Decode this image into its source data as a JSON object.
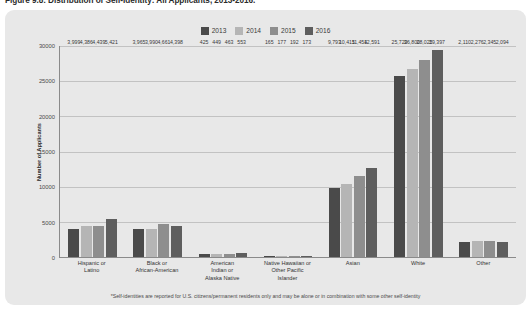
{
  "figure": {
    "title": "Figure 9.8: Distribution of Self-Identity: All Applicants, 2013-2016.",
    "footnote": "*Self-identities are reported for U.S. citizens/permanent residents only and may be alone or in combination with some other self-identity"
  },
  "legend": {
    "position": "top-center",
    "items": [
      {
        "label": "2013",
        "color": "#4a4a4a"
      },
      {
        "label": "2014",
        "color": "#b5b5b5"
      },
      {
        "label": "2015",
        "color": "#8e8e8e"
      },
      {
        "label": "2016",
        "color": "#5e5e5e"
      }
    ]
  },
  "chart_data": {
    "type": "bar",
    "title": "Figure 9.8: Distribution of Self-Identity: All Applicants, 2013-2016.",
    "xlabel": "",
    "ylabel": "Number of Applicants",
    "ylim": [
      0,
      30000
    ],
    "yticks": [
      0,
      5000,
      10000,
      15000,
      20000,
      25000,
      30000
    ],
    "ytick_labels": [
      "0",
      "5000",
      "10000",
      "15000",
      "20000",
      "25000",
      "30000"
    ],
    "grid": true,
    "categories": [
      "Hispanic or Latino",
      "Black or African-American",
      "American Indian or Alaska Native",
      "Native Hawaiian or Other Pacific Islander",
      "Asian",
      "White",
      "Other"
    ],
    "category_lines": [
      [
        "Hispanic or",
        "Latino"
      ],
      [
        "Black or",
        "African-American"
      ],
      [
        "American",
        "Indian or",
        "Alaska Native"
      ],
      [
        "Native Hawaiian or",
        "Other Pacific",
        "Islander"
      ],
      [
        "Asian"
      ],
      [
        "White"
      ],
      [
        "Other"
      ]
    ],
    "series": [
      {
        "name": "2013",
        "color": "#4a4a4a",
        "values": [
          3999,
          3965,
          425,
          165,
          9793,
          25729,
          2110
        ],
        "labels": [
          "3,999",
          "3,965",
          "425",
          "165",
          "9,793",
          "25,729",
          "2,110"
        ]
      },
      {
        "name": "2014",
        "color": "#b5b5b5",
        "values": [
          4386,
          3990,
          449,
          177,
          10415,
          26800,
          2276
        ],
        "labels": [
          "4,386",
          "3,990",
          "449",
          "177",
          "10,415",
          "26,800",
          "2,276"
        ]
      },
      {
        "name": "2015",
        "color": "#8e8e8e",
        "values": [
          4439,
          4661,
          463,
          192,
          11454,
          28025,
          2345
        ],
        "labels": [
          "4,439",
          "4,661",
          "463",
          "192",
          "11,454",
          "28,025",
          "2,345"
        ]
      },
      {
        "name": "2016",
        "color": "#5e5e5e",
        "values": [
          5421,
          4398,
          553,
          173,
          12591,
          29397,
          2094
        ],
        "labels": [
          "5,421",
          "4,398",
          "553",
          "173",
          "12,591",
          "29,397",
          "2,094"
        ]
      }
    ]
  }
}
